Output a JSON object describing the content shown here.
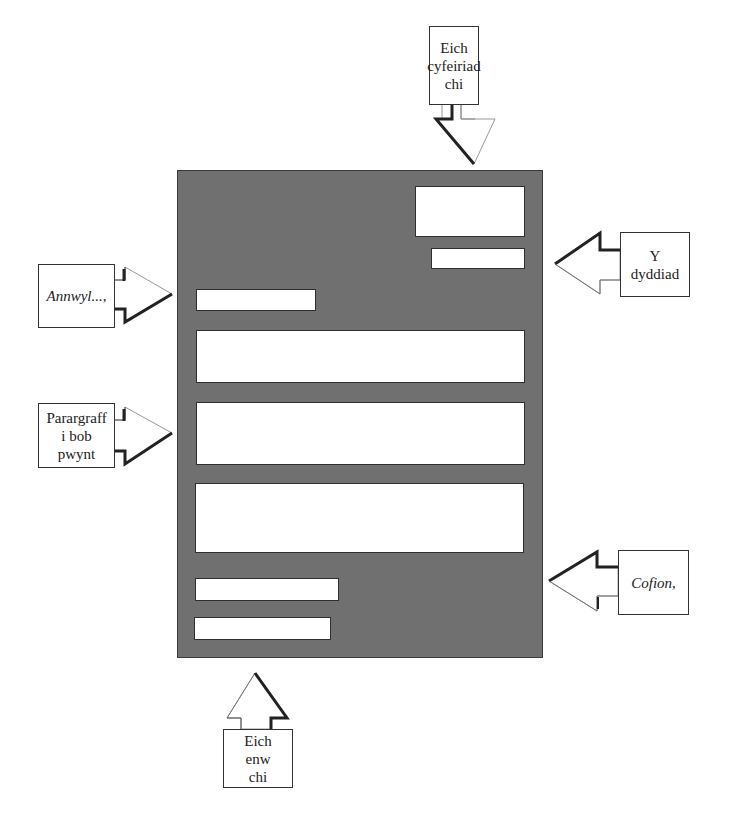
{
  "diagram": {
    "title": "",
    "document": {
      "fill_color": "#707070",
      "slots": [
        {
          "id": "address",
          "description": "address block"
        },
        {
          "id": "date",
          "description": "date line"
        },
        {
          "id": "salutation",
          "description": "greeting line"
        },
        {
          "id": "paragraph-1",
          "description": "paragraph"
        },
        {
          "id": "paragraph-2",
          "description": "paragraph"
        },
        {
          "id": "paragraph-3",
          "description": "paragraph"
        },
        {
          "id": "closing",
          "description": "sign-off line"
        },
        {
          "id": "name",
          "description": "signature name line"
        }
      ]
    },
    "labels": {
      "address": "Eich\ncyfeiriad\nchi",
      "date": "Y\ndyddiad",
      "salutation": "Annwyl...,",
      "paragraph": "Parargraff\ni bob\npwynt",
      "closing": "Cofion,",
      "name": "Eich\nenw\nchi"
    },
    "arrows": [
      {
        "from": "address",
        "direction": "down"
      },
      {
        "from": "date",
        "direction": "left"
      },
      {
        "from": "salutation",
        "direction": "right"
      },
      {
        "from": "paragraph",
        "direction": "right"
      },
      {
        "from": "closing",
        "direction": "left"
      },
      {
        "from": "name",
        "direction": "up"
      }
    ]
  }
}
